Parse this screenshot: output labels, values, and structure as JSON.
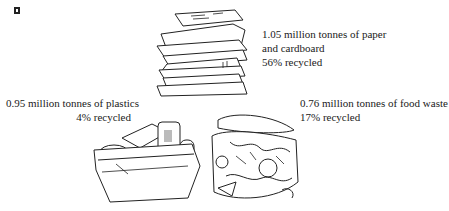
{
  "figure": {
    "items": [
      {
        "id": "paper",
        "illustration": "paper-stack-icon",
        "lines": [
          "1.05 million tonnes of paper",
          "and cardboard",
          "56% recycled"
        ],
        "tonnes_million": 1.05,
        "material": "paper and cardboard",
        "recycled_percent": 56
      },
      {
        "id": "plastics",
        "illustration": "plastics-tub-icon",
        "lines": [
          "0.95 million tonnes of plastics",
          "4% recycled"
        ],
        "tonnes_million": 0.95,
        "material": "plastics",
        "recycled_percent": 4
      },
      {
        "id": "food",
        "illustration": "food-waste-pile-icon",
        "lines": [
          "0.76 million tonnes of food waste",
          "17% recycled"
        ],
        "tonnes_million": 0.76,
        "material": "food waste",
        "recycled_percent": 17
      }
    ],
    "colors": {
      "ink": "#1a1a1a",
      "background": "#ffffff"
    }
  }
}
